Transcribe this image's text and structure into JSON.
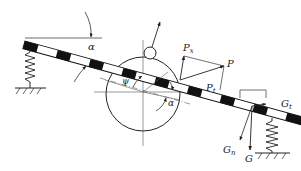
{
  "diagram": {
    "type": "mechanical force diagram",
    "labels": {
      "alpha_top": "α",
      "alpha_mid": "α",
      "psi": "ψ",
      "P": "P",
      "Px": "P",
      "Px_sub": "x",
      "Pt": "P",
      "Pt_sub": "t",
      "G": "G",
      "Gn": "G",
      "Gn_sub": "n",
      "Gt": "G",
      "Gt_sub": "t"
    },
    "colors": {
      "stroke": "#222222",
      "beam_fill_dark": "#111111",
      "beam_fill_light": "#ffffff",
      "background": "#ffffff"
    }
  }
}
